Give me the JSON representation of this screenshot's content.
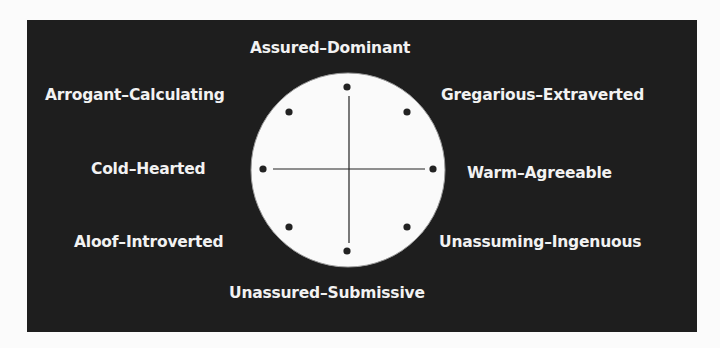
{
  "diagram": {
    "colors": {
      "panel": "#1e1e1e",
      "circle": "#fafafa",
      "text": "#f2f2f2",
      "dot": "#222222"
    },
    "labels": {
      "top": "Assured–Dominant",
      "top_left": "Arrogant–Calculating",
      "top_right": "Gregarious–Extraverted",
      "left": "Cold–Hearted",
      "right": "Warm–Agreeable",
      "bottom_left": "Aloof–Introverted",
      "bottom_right": "Unassuming–Ingenuous",
      "bottom": "Unassured–Submissive"
    }
  }
}
